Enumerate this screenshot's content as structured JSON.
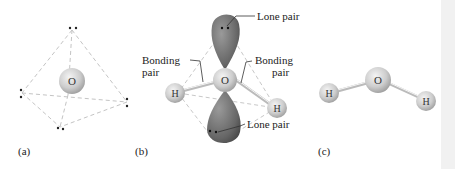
{
  "figure": {
    "panels": [
      {
        "id": "a",
        "label": "(a)",
        "atoms": [
          {
            "symbol": "O"
          }
        ],
        "description": "Tetrahedral electron-pair arrangement with O at center and four electron pairs at vertices"
      },
      {
        "id": "b",
        "label": "(b)",
        "atoms": [
          {
            "symbol": "O"
          },
          {
            "symbol": "H"
          },
          {
            "symbol": "H"
          }
        ],
        "annotations": {
          "lone_pair_top": "Lone pair",
          "lone_pair_bottom": "Lone pair",
          "bonding_pair_left_line1": "Bonding",
          "bonding_pair_left_line2": "pair",
          "bonding_pair_right_line1": "Bonding",
          "bonding_pair_right_line2": "pair"
        }
      },
      {
        "id": "c",
        "label": "(c)",
        "atoms": [
          {
            "symbol": "H"
          },
          {
            "symbol": "O"
          },
          {
            "symbol": "H"
          }
        ],
        "description": "Bent H2O molecule"
      }
    ],
    "colors": {
      "sphere": "#cfcfcf",
      "lobe": "#6e6e6e",
      "dashes": "#c8c8c8",
      "text": "#222222"
    }
  }
}
